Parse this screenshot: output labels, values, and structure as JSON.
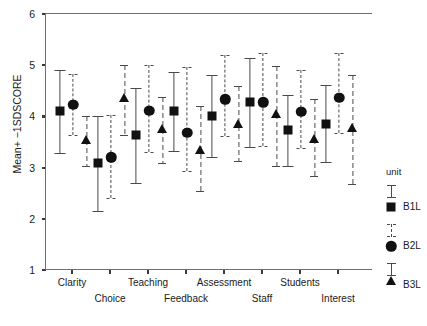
{
  "chart_data": {
    "type": "scatter",
    "title": "",
    "xlabel": "",
    "ylabel": "Mean+ −1SDSCORE",
    "ylim": [
      1,
      6
    ],
    "yticks": [
      1,
      2,
      3,
      4,
      5,
      6
    ],
    "ytick_labels": [
      "1",
      "2",
      "3",
      "4",
      "5",
      "6"
    ],
    "grid": false,
    "legend_position": "right",
    "legend_title": "unit",
    "categories": [
      "Clarity",
      "Choice",
      "Teaching",
      "Feedback",
      "Assessment",
      "Staff",
      "Students",
      "Interest"
    ],
    "series": [
      {
        "name": "B1L",
        "marker": "square",
        "line_style": "solid",
        "values": [
          4.12,
          3.11,
          3.65,
          4.13,
          4.03,
          4.3,
          3.75,
          3.88
        ],
        "ci_lower": [
          3.3,
          2.18,
          2.72,
          3.35,
          3.22,
          3.42,
          3.05,
          3.12
        ],
        "ci_upper": [
          4.92,
          4.02,
          4.58,
          4.88,
          4.82,
          5.16,
          4.44,
          4.63
        ]
      },
      {
        "name": "B2L",
        "marker": "circle",
        "line_style": "dashed",
        "values": [
          4.25,
          3.22,
          4.13,
          3.7,
          4.35,
          4.3,
          4.11,
          4.38
        ],
        "ci_lower": [
          3.66,
          2.42,
          3.33,
          2.95,
          3.63,
          3.45,
          3.4,
          3.7
        ],
        "ci_upper": [
          4.85,
          4.05,
          5.02,
          4.98,
          5.21,
          5.25,
          4.93,
          5.25
        ]
      },
      {
        "name": "B3L",
        "marker": "triangle",
        "line_style": "dashdot",
        "values": [
          3.55,
          4.38,
          3.78,
          3.36,
          3.88,
          4.07,
          3.58,
          3.8
        ],
        "ci_lower": [
          3.05,
          3.66,
          3.1,
          2.57,
          3.14,
          3.05,
          2.85,
          2.7
        ],
        "ci_upper": [
          4.02,
          5.02,
          4.4,
          4.22,
          4.62,
          5.0,
          4.35,
          4.83
        ]
      }
    ],
    "y_axis_px": {
      "value_1": 270,
      "value_6": 14
    },
    "x_group_px": [
      72,
      110,
      148,
      186,
      224,
      262,
      300,
      338
    ],
    "series_offsets_px": [
      -13,
      0,
      13
    ]
  },
  "legend": {
    "title": "unit",
    "entries": [
      {
        "label": "B1L",
        "marker": "square"
      },
      {
        "label": "B2L",
        "marker": "circle"
      },
      {
        "label": "B3L",
        "marker": "triangle"
      }
    ]
  },
  "axis": {
    "y_title": "Mean+ −1SDSCORE",
    "y_tick_labels": [
      "6",
      "5",
      "4",
      "3",
      "2",
      "1"
    ],
    "x_tick_labels_row_a": [
      "Clarity",
      "Teaching",
      "Assessment",
      "Students"
    ],
    "x_tick_labels_row_b": [
      "Choice",
      "Feedback",
      "Staff",
      "Interest"
    ]
  }
}
